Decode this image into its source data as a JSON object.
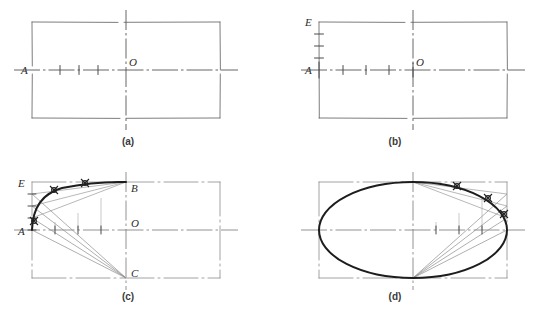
{
  "figure": {
    "background_color": "#ffffff",
    "line_color": "#3f3f3f",
    "construction_color": "#8a8a8a",
    "curve_color": "#1d1d1d",
    "centerline_color": "#7d7d7d",
    "faint_caption": ""
  },
  "panels": [
    {
      "id": "a",
      "label": "(a)",
      "label_x": 128,
      "label_y": 145,
      "rect": {
        "x": 32,
        "y": 22,
        "w": 188,
        "h": 96
      },
      "center": {
        "x": 126,
        "y": 70
      },
      "labels": [
        {
          "text": "A",
          "x": 21,
          "y": 74,
          "name": "point-label-a"
        },
        {
          "text": "O",
          "x": 129,
          "y": 66,
          "name": "point-label-o"
        }
      ],
      "axis_ticks": [
        60,
        79,
        98
      ],
      "vertical_ticks": [],
      "has_curve": false,
      "has_rays": false
    },
    {
      "id": "b",
      "label": "(b)",
      "label_x": 395,
      "label_y": 145,
      "rect": {
        "x": 319,
        "y": 22,
        "w": 188,
        "h": 96
      },
      "center": {
        "x": 413,
        "y": 70
      },
      "labels": [
        {
          "text": "E",
          "x": 307,
          "y": 26,
          "name": "point-label-e"
        },
        {
          "text": "A",
          "x": 307,
          "y": 74,
          "name": "point-label-a"
        },
        {
          "text": "O",
          "x": 416,
          "y": 66,
          "name": "point-label-o"
        }
      ],
      "axis_ticks": [
        343,
        366,
        389
      ],
      "vertical_ticks": [
        34,
        46,
        58
      ],
      "has_curve": false,
      "has_rays": false
    },
    {
      "id": "c",
      "label": "(c)",
      "label_x": 128,
      "label_y": 300,
      "rect": {
        "x": 32,
        "y": 182,
        "w": 188,
        "h": 96
      },
      "center": {
        "x": 126,
        "y": 230
      },
      "labels": [
        {
          "text": "E",
          "x": 20,
          "y": 186,
          "name": "point-label-e"
        },
        {
          "text": "A",
          "x": 20,
          "y": 234,
          "name": "point-label-a"
        },
        {
          "text": "B",
          "x": 130,
          "y": 192,
          "name": "point-label-b"
        },
        {
          "text": "O",
          "x": 130,
          "y": 226,
          "name": "point-label-o"
        },
        {
          "text": "C",
          "x": 130,
          "y": 276,
          "name": "point-label-c"
        }
      ],
      "axis_ticks": [
        55,
        78,
        101
      ],
      "vertical_ticks": [
        194,
        206,
        218
      ],
      "has_curve": true,
      "has_rays": true,
      "quadrant": "upper-left"
    },
    {
      "id": "d",
      "label": "(d)",
      "label_x": 395,
      "label_y": 300,
      "rect": {
        "x": 319,
        "y": 182,
        "w": 188,
        "h": 96
      },
      "center": {
        "x": 413,
        "y": 230
      },
      "labels": [],
      "axis_ticks": [
        436,
        459,
        482
      ],
      "vertical_ticks": [],
      "has_curve": true,
      "has_rays": true,
      "quadrant": "full-ellipse"
    }
  ]
}
